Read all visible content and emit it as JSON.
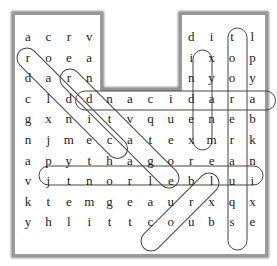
{
  "puzzle": {
    "type": "word-search",
    "rows": 11,
    "cols": 12,
    "grid": [
      [
        "a",
        "c",
        "r",
        "v",
        "",
        "",
        "",
        "",
        "d",
        "i",
        "t",
        "l"
      ],
      [
        "r",
        "o",
        "e",
        "a",
        "",
        "",
        "",
        "",
        "i",
        "x",
        "o",
        "p"
      ],
      [
        "d",
        "a",
        "r",
        "n",
        "",
        "",
        "",
        "",
        "n",
        "y",
        "o",
        "y"
      ],
      [
        "c",
        "l",
        "d",
        "d",
        "n",
        "a",
        "c",
        "i",
        "d",
        "a",
        "r",
        "a"
      ],
      [
        "g",
        "x",
        "n",
        "i",
        "t",
        "v",
        "q",
        "u",
        "e",
        "n",
        "e",
        "b"
      ],
      [
        "n",
        "j",
        "m",
        "e",
        "c",
        "a",
        "t",
        "e",
        "x",
        "m",
        "r",
        "k"
      ],
      [
        "a",
        "p",
        "y",
        "t",
        "h",
        "a",
        "g",
        "o",
        "r",
        "e",
        "a",
        "n"
      ],
      [
        "v",
        "j",
        "t",
        "n",
        "o",
        "r",
        "l",
        "e",
        "b",
        "l",
        "u",
        "i"
      ],
      [
        "k",
        "t",
        "e",
        "m",
        "g",
        "e",
        "a",
        "u",
        "r",
        "x",
        "q",
        "x"
      ],
      [
        "y",
        "h",
        "l",
        "i",
        "t",
        "t",
        "c",
        "o",
        "u",
        "b",
        "s",
        "e"
      ]
    ],
    "found_words": [
      {
        "word": "radar",
        "direction": "horizontal-reverse",
        "start": [
          3,
          10
        ],
        "end": [
          3,
          3
        ]
      },
      {
        "word": "index",
        "direction": "vertical",
        "start": [
          1,
          8
        ],
        "end": [
          5,
          8
        ]
      },
      {
        "word": "tourqs",
        "direction": "vertical",
        "start": [
          0,
          10
        ],
        "end": [
          9,
          10
        ]
      },
      {
        "word": "pythagorean",
        "direction": "horizontal",
        "start": [
          6,
          1
        ],
        "end": [
          6,
          11
        ]
      },
      {
        "word": "diagonal-1",
        "direction": "diagonal-down-right",
        "start": [
          1,
          0
        ],
        "end": [
          6,
          5
        ]
      },
      {
        "word": "diagonal-2",
        "direction": "diagonal-down-right",
        "start": [
          2,
          2
        ],
        "end": [
          7,
          6
        ]
      },
      {
        "word": "cube",
        "direction": "diagonal-up-right",
        "start": [
          9,
          6
        ],
        "end": [
          6,
          9
        ]
      }
    ]
  }
}
